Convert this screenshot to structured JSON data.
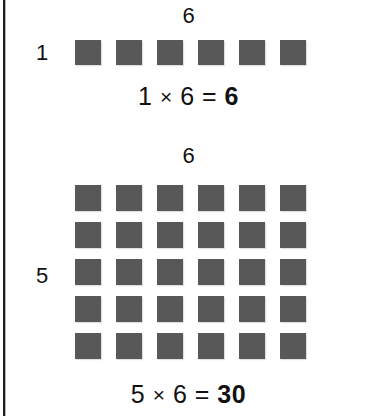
{
  "figure": {
    "background_color": "#ffffff",
    "square_color": "#585858",
    "text_color": "#111111",
    "rule_color": "#1c1c1c"
  },
  "blocks": [
    {
      "id": "array-1x6",
      "column_label": "6",
      "row_label": "1",
      "rows": 1,
      "columns": 6,
      "total_squares": 6,
      "equation": {
        "left_factor": "1",
        "operator": "×",
        "right_factor": "6",
        "equals": "=",
        "product": "6",
        "full_text": "1 × 6 = 6"
      }
    },
    {
      "id": "array-5x6",
      "column_label": "6",
      "row_label": "5",
      "rows": 5,
      "columns": 6,
      "total_squares": 30,
      "equation": {
        "left_factor": "5",
        "operator": "×",
        "right_factor": "6",
        "equals": "=",
        "product": "30",
        "full_text": "5 × 6 = 30"
      }
    }
  ]
}
